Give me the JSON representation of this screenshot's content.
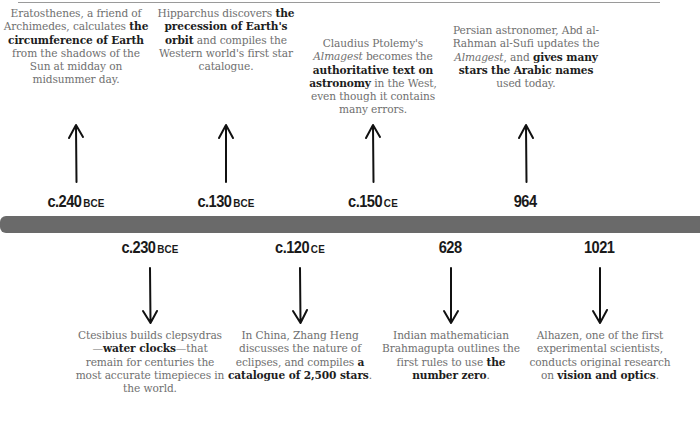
{
  "timeline": {
    "bar_color": "#6a6a6a",
    "text_color": "#6f6f6f",
    "emphasis_color": "#1d1d1d",
    "events_above": [
      {
        "date_number": "c.240",
        "date_era": "BCE",
        "arrow": "up-arrow",
        "center_x": 76,
        "description": [
          {
            "text": "Eratosthenes, a friend of Archimedes, calculates ",
            "style": "normal"
          },
          {
            "text": "the circumference of Earth",
            "style": "bold"
          },
          {
            "text": " from the shadows of the Sun at midday on midsummer day.",
            "style": "normal"
          }
        ]
      },
      {
        "date_number": "c.130",
        "date_era": "BCE",
        "arrow": "up-arrow",
        "center_x": 226,
        "description": [
          {
            "text": "Hipparchus discovers ",
            "style": "normal"
          },
          {
            "text": "the precession of Earth's orbit",
            "style": "bold"
          },
          {
            "text": " and compiles the Western world's first star catalogue.",
            "style": "normal"
          }
        ]
      },
      {
        "date_number": "c.150",
        "date_era": "CE",
        "arrow": "up-arrow",
        "center_x": 373,
        "description": [
          {
            "text": "Claudius Ptolemy's ",
            "style": "normal"
          },
          {
            "text": "Almagest",
            "style": "italic"
          },
          {
            "text": " becomes the ",
            "style": "normal"
          },
          {
            "text": "authoritative text on astronomy",
            "style": "bold"
          },
          {
            "text": " in the West, even though it contains many errors.",
            "style": "normal"
          }
        ]
      },
      {
        "date_number": "964",
        "date_era": "",
        "arrow": "up-arrow",
        "center_x": 526,
        "description": [
          {
            "text": "Persian astronomer, Abd al-Rahman al-Sufi updates the ",
            "style": "normal"
          },
          {
            "text": "Almagest",
            "style": "italic"
          },
          {
            "text": ", and ",
            "style": "normal"
          },
          {
            "text": "gives many stars the Arabic names",
            "style": "bold"
          },
          {
            "text": " used today.",
            "style": "normal"
          }
        ]
      }
    ],
    "events_below": [
      {
        "date_number": "c.230",
        "date_era": "BCE",
        "arrow": "down-arrow",
        "center_x": 150,
        "description": [
          {
            "text": "Ctesibius builds clepsydras—",
            "style": "normal"
          },
          {
            "text": "water clocks",
            "style": "bold"
          },
          {
            "text": "—that remain for centuries the most accurate timepieces in the world.",
            "style": "normal"
          }
        ]
      },
      {
        "date_number": "c.120",
        "date_era": "CE",
        "arrow": "down-arrow",
        "center_x": 300,
        "description": [
          {
            "text": "In China, Zhang Heng discusses the nature of eclipses, and compiles ",
            "style": "normal"
          },
          {
            "text": "a catalogue of 2,500 stars",
            "style": "bold"
          },
          {
            "text": ".",
            "style": "normal"
          }
        ]
      },
      {
        "date_number": "628",
        "date_era": "",
        "arrow": "down-arrow",
        "center_x": 451,
        "description": [
          {
            "text": "Indian mathematician Brahmagupta outlines the first rules to use ",
            "style": "normal"
          },
          {
            "text": "the number zero",
            "style": "bold"
          },
          {
            "text": ".",
            "style": "normal"
          }
        ]
      },
      {
        "date_number": "1021",
        "date_era": "",
        "arrow": "down-arrow",
        "center_x": 600,
        "description": [
          {
            "text": "Alhazen, one of the first experimental scientists, conducts original research on ",
            "style": "normal"
          },
          {
            "text": "vision and optics",
            "style": "bold"
          },
          {
            "text": ".",
            "style": "normal"
          }
        ]
      }
    ]
  }
}
